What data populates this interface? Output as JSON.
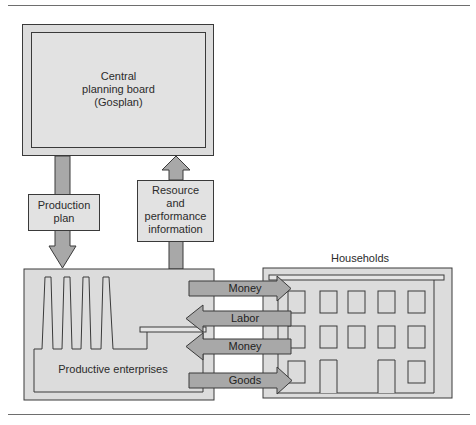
{
  "diagram": {
    "central_board": {
      "label_lines": [
        "Central",
        "planning board",
        "(Gosplan)"
      ]
    },
    "production_plan": {
      "label_lines": [
        "Production",
        "plan"
      ],
      "direction": "down"
    },
    "resource_info": {
      "label_lines": [
        "Resource",
        "and",
        "performance",
        "information"
      ],
      "direction": "up"
    },
    "productive_enterprises": {
      "label": "Productive enterprises"
    },
    "households": {
      "label": "Households"
    },
    "flows": [
      {
        "label": "Money",
        "direction": "right"
      },
      {
        "label": "Labor",
        "direction": "left"
      },
      {
        "label": "Money",
        "direction": "left"
      },
      {
        "label": "Goods",
        "direction": "right"
      }
    ]
  },
  "colors": {
    "box_fill": "#dcdcdc",
    "inner_fill": "#e3e3e3",
    "arrow_fill": "#a8a8a8",
    "outline": "#3a3a3a",
    "rule": "#6e6e6e"
  }
}
